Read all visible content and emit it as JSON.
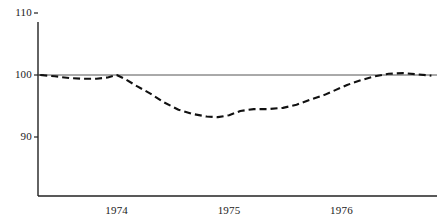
{
  "chart_data": {
    "type": "line",
    "title": "",
    "xlabel": "",
    "ylabel": "",
    "ylim": [
      80,
      110
    ],
    "xlim": [
      1973.3,
      1976.85
    ],
    "grid": false,
    "legend": null,
    "reference_line": {
      "value": 100,
      "style": "solid",
      "color": "#555555"
    },
    "yticks": [
      {
        "value": 110,
        "label": "110"
      },
      {
        "value": 100,
        "label": "100"
      },
      {
        "value": 90,
        "label": "90"
      }
    ],
    "xticks": [
      {
        "value": 1974,
        "label": "1974"
      },
      {
        "value": 1975,
        "label": "1975"
      },
      {
        "value": 1976,
        "label": "1976"
      }
    ],
    "series": [
      {
        "name": "index",
        "style": "dashed",
        "color": "#111111",
        "x": [
          1973.32,
          1973.45,
          1973.58,
          1973.7,
          1973.82,
          1973.92,
          1974.0,
          1974.08,
          1974.18,
          1974.3,
          1974.42,
          1974.55,
          1974.68,
          1974.8,
          1974.9,
          1975.0,
          1975.1,
          1975.22,
          1975.35,
          1975.48,
          1975.6,
          1975.72,
          1975.85,
          1975.95,
          1976.05,
          1976.18,
          1976.3,
          1976.42,
          1976.55,
          1976.68,
          1976.8
        ],
        "y": [
          100.0,
          99.8,
          99.5,
          99.4,
          99.4,
          99.6,
          100.0,
          99.3,
          98.2,
          97.0,
          95.6,
          94.4,
          93.7,
          93.3,
          93.2,
          93.5,
          94.2,
          94.5,
          94.5,
          94.7,
          95.2,
          96.0,
          96.8,
          97.6,
          98.4,
          99.2,
          99.8,
          100.2,
          100.3,
          100.1,
          99.9
        ]
      }
    ]
  },
  "axes": {
    "y_axis_label": "",
    "x_axis_label": ""
  }
}
